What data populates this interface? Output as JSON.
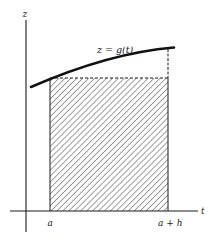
{
  "figure": {
    "axes": {
      "vertical_label": "z",
      "horizontal_label": "t"
    },
    "curve": {
      "label": "z = g(t)"
    },
    "region": {
      "left_label": "a",
      "right_label": "a + h",
      "fill": "diagonal-hatch"
    },
    "colors": {
      "ink": "#1a1a1a",
      "background": "#ffffff"
    }
  }
}
